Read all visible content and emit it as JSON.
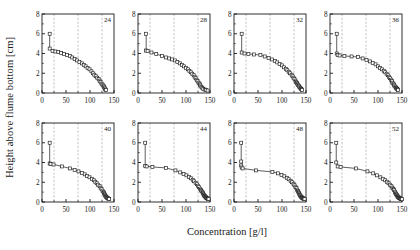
{
  "figure": {
    "xlabel": "Concentration [g/l]",
    "ylabel": "Height above flume bottom [cm]"
  },
  "style": {
    "axis_color": "#1a1a1a",
    "grid_color": "#9a9a9a",
    "marker_edge": "#1a1a1a",
    "marker_face": "#ffffff",
    "line_color": "#1a1a1a",
    "background": "#ffffff"
  },
  "chart_data": {
    "type": "scatter",
    "title": "",
    "xlabel": "Concentration [g/l]",
    "ylabel": "Height above flume bottom [cm]",
    "xlim": [
      0,
      150
    ],
    "ylim": [
      0,
      8
    ],
    "xticks": [
      0,
      50,
      100,
      150
    ],
    "yticks": [
      0,
      2,
      4,
      6,
      8
    ],
    "xminor": [
      25,
      75,
      125
    ],
    "yminor": [
      1,
      3,
      5,
      7
    ],
    "grid": "vertical-dashed-at-minor-x",
    "legend": "none",
    "panel_layout": {
      "rows": 2,
      "cols": 4
    },
    "panels": [
      {
        "label": "24",
        "x": [
          16,
          16,
          22,
          28,
          34,
          40,
          46,
          52,
          58,
          63,
          68,
          73,
          78,
          83,
          87,
          91,
          95,
          99,
          103,
          106,
          109,
          112,
          115,
          118,
          120,
          122,
          124,
          126,
          128,
          129,
          130,
          131,
          132,
          133
        ],
        "y": [
          6.0,
          4.5,
          4.25,
          4.2,
          4.15,
          4.05,
          3.95,
          3.85,
          3.75,
          3.6,
          3.45,
          3.3,
          3.15,
          3.0,
          2.85,
          2.7,
          2.55,
          2.4,
          2.2,
          2.0,
          1.85,
          1.7,
          1.55,
          1.4,
          1.25,
          1.1,
          0.95,
          0.85,
          0.75,
          0.65,
          0.55,
          0.45,
          0.35,
          0.3
        ]
      },
      {
        "label": "28",
        "x": [
          17,
          17,
          20,
          28,
          38,
          50,
          58,
          65,
          71,
          77,
          82,
          87,
          92,
          96,
          100,
          104,
          107,
          110,
          113,
          116,
          118,
          120,
          122,
          124,
          126,
          128,
          129,
          130,
          132,
          134,
          136,
          139,
          142,
          145
        ],
        "y": [
          6.0,
          4.3,
          4.25,
          4.1,
          3.95,
          3.75,
          3.6,
          3.5,
          3.4,
          3.3,
          3.15,
          3.0,
          2.85,
          2.7,
          2.55,
          2.4,
          2.25,
          2.1,
          1.95,
          1.8,
          1.65,
          1.5,
          1.35,
          1.2,
          1.05,
          0.95,
          0.85,
          0.75,
          0.6,
          0.5,
          0.4,
          0.35,
          0.3,
          0.25
        ]
      },
      {
        "label": "32",
        "x": [
          16,
          16,
          22,
          30,
          42,
          55,
          64,
          72,
          79,
          85,
          90,
          95,
          100,
          104,
          108,
          111,
          114,
          117,
          120,
          122,
          124,
          126,
          128,
          129,
          131,
          132,
          133,
          135,
          136,
          138,
          139,
          140,
          141,
          142
        ],
        "y": [
          6.0,
          4.1,
          4.0,
          3.95,
          3.9,
          3.85,
          3.7,
          3.55,
          3.4,
          3.25,
          3.1,
          2.95,
          2.8,
          2.6,
          2.45,
          2.3,
          2.15,
          2.0,
          1.85,
          1.7,
          1.55,
          1.4,
          1.25,
          1.1,
          1.0,
          0.9,
          0.8,
          0.7,
          0.6,
          0.5,
          0.45,
          0.4,
          0.35,
          0.3
        ]
      },
      {
        "label": "36",
        "x": [
          14,
          14,
          16,
          20,
          30,
          45,
          58,
          68,
          76,
          83,
          89,
          95,
          100,
          104,
          108,
          112,
          115,
          118,
          121,
          123,
          125,
          127,
          129,
          130,
          132,
          133,
          134,
          136,
          137,
          138,
          139,
          140,
          141,
          142
        ],
        "y": [
          6.0,
          4.0,
          3.85,
          3.8,
          3.75,
          3.7,
          3.65,
          3.5,
          3.35,
          3.2,
          3.05,
          2.9,
          2.7,
          2.55,
          2.4,
          2.25,
          2.1,
          1.95,
          1.8,
          1.65,
          1.5,
          1.35,
          1.2,
          1.05,
          0.95,
          0.85,
          0.75,
          0.65,
          0.55,
          0.5,
          0.45,
          0.4,
          0.35,
          0.3
        ]
      },
      {
        "label": "40",
        "x": [
          16,
          16,
          18,
          24,
          42,
          58,
          68,
          76,
          83,
          89,
          94,
          99,
          104,
          108,
          111,
          114,
          117,
          120,
          122,
          124,
          126,
          128,
          129,
          130,
          131,
          132,
          133,
          134,
          135,
          136,
          137,
          138,
          139,
          140
        ],
        "y": [
          6.0,
          3.9,
          3.85,
          3.8,
          3.6,
          3.4,
          3.25,
          3.1,
          2.95,
          2.8,
          2.65,
          2.5,
          2.35,
          2.2,
          2.05,
          1.9,
          1.75,
          1.6,
          1.45,
          1.3,
          1.15,
          1.0,
          0.9,
          0.8,
          0.7,
          0.6,
          0.55,
          0.5,
          0.45,
          0.4,
          0.38,
          0.35,
          0.32,
          0.3
        ]
      },
      {
        "label": "44",
        "x": [
          15,
          15,
          18,
          30,
          58,
          78,
          88,
          95,
          101,
          106,
          110,
          114,
          117,
          120,
          123,
          125,
          127,
          129,
          131,
          132,
          134,
          135,
          136,
          137,
          138,
          139,
          140,
          141,
          142,
          143,
          144,
          145,
          146,
          147
        ],
        "y": [
          6.0,
          3.65,
          3.6,
          3.55,
          3.45,
          3.2,
          3.0,
          2.85,
          2.7,
          2.55,
          2.4,
          2.25,
          2.1,
          1.95,
          1.8,
          1.65,
          1.5,
          1.35,
          1.2,
          1.1,
          1.0,
          0.9,
          0.8,
          0.7,
          0.65,
          0.6,
          0.55,
          0.5,
          0.45,
          0.4,
          0.38,
          0.35,
          0.32,
          0.3
        ]
      },
      {
        "label": "48",
        "x": [
          15,
          15,
          15,
          16,
          18,
          46,
          80,
          92,
          99,
          105,
          110,
          114,
          118,
          121,
          124,
          126,
          128,
          130,
          131,
          133,
          134,
          135,
          136,
          137,
          138,
          139,
          140,
          141,
          142,
          143,
          144,
          145,
          146,
          147
        ],
        "y": [
          6.0,
          4.1,
          3.7,
          3.5,
          3.4,
          3.2,
          3.05,
          2.9,
          2.75,
          2.6,
          2.45,
          2.3,
          2.15,
          2.0,
          1.85,
          1.7,
          1.55,
          1.4,
          1.25,
          1.1,
          1.0,
          0.9,
          0.8,
          0.72,
          0.65,
          0.58,
          0.52,
          0.48,
          0.44,
          0.4,
          0.37,
          0.34,
          0.32,
          0.3
        ]
      },
      {
        "label": "52",
        "x": [
          13,
          13,
          16,
          22,
          54,
          78,
          90,
          98,
          105,
          110,
          115,
          119,
          122,
          125,
          128,
          130,
          132,
          133,
          135,
          136,
          137,
          138,
          139,
          140,
          141,
          142,
          143,
          144,
          145,
          146,
          147,
          148,
          149,
          150
        ],
        "y": [
          6.0,
          4.0,
          3.6,
          3.55,
          3.4,
          3.1,
          2.9,
          2.7,
          2.5,
          2.35,
          2.2,
          2.05,
          1.9,
          1.75,
          1.6,
          1.45,
          1.3,
          1.2,
          1.05,
          0.95,
          0.85,
          0.78,
          0.7,
          0.63,
          0.57,
          0.52,
          0.47,
          0.43,
          0.4,
          0.37,
          0.34,
          0.32,
          0.3,
          0.28
        ]
      }
    ]
  }
}
